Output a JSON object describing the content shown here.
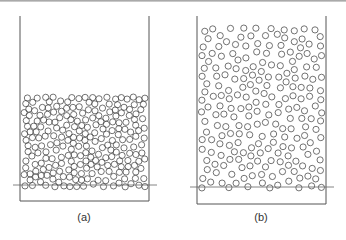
{
  "figure": {
    "colors": {
      "stroke": "#555555",
      "particle": "#444444",
      "ground_line": "#666666",
      "caption": "#333333"
    },
    "panels": [
      {
        "id": "a",
        "caption": "(a)",
        "state": "packed bed",
        "container": {
          "x": 20,
          "y": 16,
          "width": 129,
          "height": 185
        },
        "ground_line": {
          "x1": 13,
          "x2": 157,
          "y": 185
        },
        "particles": {
          "count": 330,
          "region_top": 94,
          "region_bottom": 190,
          "radius": 3.1,
          "seed": 7
        },
        "caption_pos": {
          "x": 66,
          "y": 211
        }
      },
      {
        "id": "b",
        "caption": "(b)",
        "state": "fluidized bed",
        "container": {
          "x": 197,
          "y": 16,
          "width": 129,
          "height": 188
        },
        "ground_line": {
          "x1": 190,
          "x2": 334,
          "y": 187
        },
        "particles": {
          "count": 330,
          "region_top": 25,
          "region_bottom": 191,
          "radius": 3.1,
          "seed": 19
        },
        "caption_pos": {
          "x": 243,
          "y": 211
        }
      }
    ]
  }
}
